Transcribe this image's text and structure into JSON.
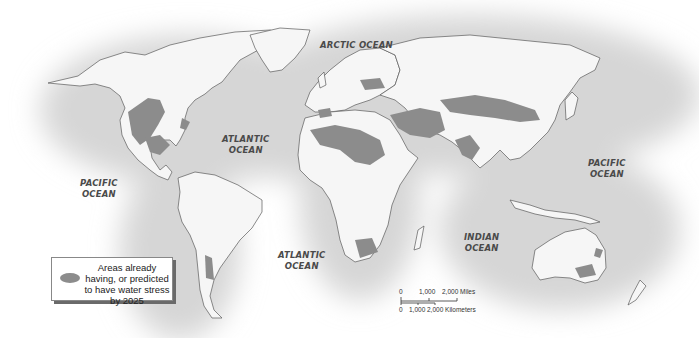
{
  "map": {
    "title": "World water stress map",
    "colors": {
      "background": "#ffffff",
      "ocean_glow": "#dcdcdc",
      "land": "#f6f6f6",
      "border": "#5a5a5a",
      "water_stress": "#8c8c8c"
    },
    "ocean_labels": [
      {
        "id": "arctic",
        "line1": "ARCTIC OCEAN",
        "line2": ""
      },
      {
        "id": "atlantic-north",
        "line1": "ATLANTIC",
        "line2": "OCEAN"
      },
      {
        "id": "pacific-west",
        "line1": "PACIFIC",
        "line2": "OCEAN"
      },
      {
        "id": "atlantic-south",
        "line1": "ATLANTIC",
        "line2": "OCEAN"
      },
      {
        "id": "indian",
        "line1": "INDIAN",
        "line2": "OCEAN"
      },
      {
        "id": "pacific-east",
        "line1": "PACIFIC",
        "line2": "OCEAN"
      }
    ],
    "legend": {
      "swatch_icon": "gray-ellipse",
      "text": "Areas already having, or predicted to have water stress by 2025"
    },
    "scale_bar": {
      "miles_labels": [
        "0",
        "1,000",
        "2,000 Miles"
      ],
      "km_labels": [
        "0",
        "1,000",
        "2,000 Kilometers"
      ]
    }
  }
}
